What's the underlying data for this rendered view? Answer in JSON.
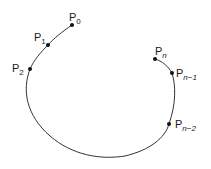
{
  "diagram": {
    "type": "open-curve-with-points",
    "curve_color": "#333333",
    "point_color": "#111111",
    "points": [
      {
        "id": "p0",
        "base": "P",
        "sub": "0",
        "x": 72,
        "y": 25
      },
      {
        "id": "p1",
        "base": "P",
        "sub": "1",
        "x": 48,
        "y": 45
      },
      {
        "id": "p2",
        "base": "P",
        "sub": "2",
        "x": 30,
        "y": 69
      },
      {
        "id": "pn",
        "base": "P",
        "sub": "n",
        "x": 155,
        "y": 59
      },
      {
        "id": "pn1",
        "base": "P",
        "sub": "n−1",
        "x": 172,
        "y": 73
      },
      {
        "id": "pn2",
        "base": "P",
        "sub": "n−2",
        "x": 169,
        "y": 124
      }
    ]
  }
}
